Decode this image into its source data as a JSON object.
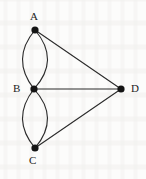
{
  "figure": {
    "kind": "undirected-multigraph",
    "background_color": "#fcfcfb",
    "ink_color": "#2b2b2b",
    "vertex_fill": "#141414",
    "vertex_radius": 3.6,
    "edge_width": 1.1,
    "canvas": {
      "width": 146,
      "height": 179
    }
  },
  "vertices": [
    {
      "id": "A",
      "label": "A",
      "x": 35,
      "y": 30,
      "label_x": 30,
      "label_y": 11
    },
    {
      "id": "B",
      "label": "B",
      "x": 34,
      "y": 89,
      "label_x": 13,
      "label_y": 83
    },
    {
      "id": "C",
      "label": "C",
      "x": 35,
      "y": 148,
      "label_x": 29,
      "label_y": 155
    },
    {
      "id": "D",
      "label": "D",
      "x": 121,
      "y": 89,
      "label_x": 131,
      "label_y": 83
    }
  ],
  "edges": [
    {
      "id": "e1",
      "from": "A",
      "to": "B",
      "style": "curved",
      "bow": -13,
      "name": "edge-a-b-left"
    },
    {
      "id": "e2",
      "from": "A",
      "to": "B",
      "style": "curved",
      "bow": 12,
      "name": "edge-a-b-right"
    },
    {
      "id": "e3",
      "from": "B",
      "to": "C",
      "style": "curved",
      "bow": -13,
      "name": "edge-b-c-left"
    },
    {
      "id": "e4",
      "from": "B",
      "to": "C",
      "style": "curved",
      "bow": 12,
      "name": "edge-b-c-right"
    },
    {
      "id": "e5",
      "from": "A",
      "to": "D",
      "style": "straight",
      "bow": 0,
      "name": "edge-a-d"
    },
    {
      "id": "e6",
      "from": "B",
      "to": "D",
      "style": "straight",
      "bow": 0,
      "name": "edge-b-d"
    },
    {
      "id": "e7",
      "from": "C",
      "to": "D",
      "style": "straight",
      "bow": 0,
      "name": "edge-c-d"
    }
  ],
  "chart_data": {
    "type": "graph",
    "title": "",
    "nodes": [
      "A",
      "B",
      "C",
      "D"
    ],
    "edge_list": [
      [
        "A",
        "B"
      ],
      [
        "A",
        "B"
      ],
      [
        "B",
        "C"
      ],
      [
        "B",
        "C"
      ],
      [
        "A",
        "D"
      ],
      [
        "B",
        "D"
      ],
      [
        "C",
        "D"
      ]
    ],
    "degrees": {
      "A": 3,
      "B": 5,
      "C": 3,
      "D": 3
    },
    "edge_count": 7,
    "node_count": 4
  }
}
